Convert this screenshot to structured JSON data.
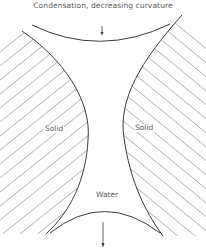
{
  "title": "Condensation, decreasing  curvature",
  "regions": {
    "left_solid": {
      "label": "Solid"
    },
    "right_solid": {
      "label": "Solid"
    },
    "liquid": {
      "label": "Water"
    }
  },
  "arrows": {
    "top": {
      "direction": "down",
      "meaning": "condensation"
    },
    "bottom": {
      "direction": "down"
    }
  },
  "colors": {
    "boundary": "#3a3a3a",
    "hatch": "#9a9a9a",
    "text": "#5a5a5a",
    "background": "#ffffff"
  }
}
